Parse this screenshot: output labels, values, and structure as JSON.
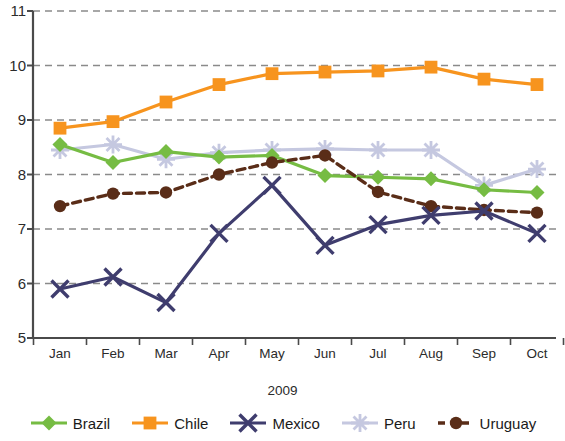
{
  "chart_data": {
    "type": "line",
    "title": "",
    "xlabel": "2009",
    "ylabel": "",
    "categories": [
      "Jan",
      "Feb",
      "Mar",
      "Apr",
      "May",
      "Jun",
      "Jul",
      "Aug",
      "Sep",
      "Oct"
    ],
    "ylim": [
      5,
      11
    ],
    "yticks": [
      5,
      6,
      7,
      8,
      9,
      10,
      11
    ],
    "grid": true,
    "legend_position": "bottom",
    "series": [
      {
        "name": "Brazil",
        "color": "#76BC43",
        "marker": "diamond",
        "line_style": "solid",
        "values": [
          8.55,
          8.22,
          8.42,
          8.32,
          8.35,
          7.98,
          7.95,
          7.92,
          7.72,
          7.67
        ]
      },
      {
        "name": "Chile",
        "color": "#F7941E",
        "marker": "square",
        "line_style": "solid",
        "values": [
          8.85,
          8.97,
          9.33,
          9.65,
          9.85,
          9.88,
          9.9,
          9.97,
          9.75,
          9.65
        ]
      },
      {
        "name": "Mexico",
        "color": "#3F3D6E",
        "marker": "x",
        "line_style": "solid",
        "values": [
          5.9,
          6.12,
          5.65,
          6.92,
          7.8,
          6.7,
          7.08,
          7.25,
          7.33,
          6.92
        ]
      },
      {
        "name": "Peru",
        "color": "#C5C8E0",
        "marker": "asterisk",
        "line_style": "solid",
        "values": [
          8.45,
          8.55,
          8.28,
          8.4,
          8.45,
          8.47,
          8.45,
          8.45,
          7.8,
          8.1
        ]
      },
      {
        "name": "Uruguay",
        "color": "#5A2D18",
        "marker": "circle",
        "line_style": "dashed",
        "values": [
          7.42,
          7.65,
          7.67,
          8.0,
          8.22,
          8.35,
          7.68,
          7.42,
          7.35,
          7.3
        ]
      }
    ]
  },
  "axis": {
    "x_title": "2009"
  }
}
